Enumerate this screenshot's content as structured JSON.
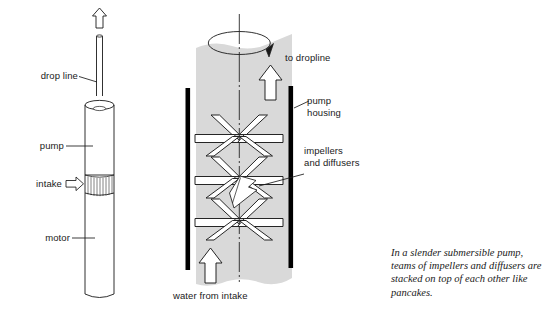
{
  "figure": {
    "background_color": "#ffffff",
    "ink_color": "#1a1a1a",
    "shading_color": "#d9d9d9",
    "housing_color": "#000000"
  },
  "left_diagram": {
    "name": "submersible pump exterior view",
    "labels": {
      "drop_line": "drop line",
      "pump": "pump",
      "intake": "intake",
      "motor": "motor"
    },
    "flow_arrow": "up-arrow-outline"
  },
  "right_diagram": {
    "name": "pump interior cutaway",
    "labels": {
      "to_dropline": "to dropline",
      "pump_housing_line1": "pump",
      "pump_housing_line2": "housing",
      "impellers_line1": "impellers",
      "impellers_line2": "and diffusers",
      "water_from_intake": "water from intake"
    },
    "rotation_indicator": "rotation-ellipse-arrow",
    "flow_arrow_top": "up-arrow-outline",
    "flow_arrow_bottom": "up-arrow-outline",
    "impeller_stage_count": 3
  },
  "caption": {
    "line1": "In a slender submersible pump,",
    "line2": "teams of impellers and diffusers are",
    "line3": "stacked on top of each other like",
    "line4": "pancakes."
  }
}
